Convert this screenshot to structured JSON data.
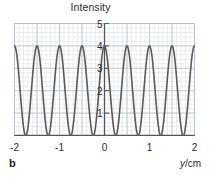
{
  "figure": {
    "panel_label": "b",
    "title": "Intensity",
    "x_axis_title_variable": "y",
    "x_axis_title_unit": "/cm",
    "x_axis_title": "y/cm"
  },
  "colors": {
    "curve": "#5a5a5a",
    "axis": "#555555",
    "grid_major": "#b9c3cc",
    "grid_minor": "#dfe5ea",
    "text": "#2b2b2b",
    "background": "#ffffff"
  },
  "chart_data": {
    "type": "line",
    "title": "Intensity",
    "xlabel": "y/cm",
    "ylabel": "Intensity",
    "xlim": [
      -2,
      2
    ],
    "ylim": [
      0,
      5
    ],
    "grid": true,
    "grid_major_x_step": 0.5,
    "grid_major_y_step": 1,
    "grid_minor_x_step": 0.1,
    "grid_minor_y_step": 0.2,
    "legend": "none",
    "xticks": [
      -2,
      -1,
      0,
      1,
      2
    ],
    "xtick_labels": [
      "-2",
      "-1",
      "0",
      "1",
      "2"
    ],
    "yticks": [
      1,
      2,
      3,
      4,
      5
    ],
    "ytick_labels": [
      "1",
      "2",
      "3",
      "4",
      "5"
    ],
    "function": "I = 4*cos(pi*y/0.5)^2",
    "amplitude_max": 4,
    "amplitude_min": 0,
    "period_cm": 0.5,
    "peak_positions": [
      -1.75,
      -1.25,
      -0.75,
      -0.25,
      0.25,
      0.75,
      1.25,
      1.75
    ],
    "peak_value": 4,
    "minima_positions": [
      -2.0,
      -1.5,
      -1.0,
      -0.5,
      0.0,
      0.5,
      1.0,
      1.5,
      2.0
    ],
    "minimum_value": 0,
    "peaks_visible_count": 8,
    "edge_values": {
      "left_x": -2,
      "left_y": 0,
      "right_x": 2,
      "right_y": 0
    },
    "series": [
      {
        "name": "Intensity",
        "x": [
          -2.0,
          -1.95,
          -1.9,
          -1.85,
          -1.8,
          -1.75,
          -1.7,
          -1.65,
          -1.6,
          -1.55,
          -1.5,
          -1.45,
          -1.4,
          -1.35,
          -1.3,
          -1.25,
          -1.2,
          -1.15,
          -1.1,
          -1.05,
          -1.0,
          -0.95,
          -0.9,
          -0.85,
          -0.8,
          -0.75,
          -0.7,
          -0.65,
          -0.6,
          -0.55,
          -0.5,
          -0.45,
          -0.4,
          -0.35,
          -0.3,
          -0.25,
          -0.2,
          -0.15,
          -0.1,
          -0.05,
          0.0,
          0.05,
          0.1,
          0.15,
          0.2,
          0.25,
          0.3,
          0.35,
          0.4,
          0.45,
          0.5,
          0.55,
          0.6,
          0.65,
          0.7,
          0.75,
          0.8,
          0.85,
          0.9,
          0.95,
          1.0,
          1.05,
          1.1,
          1.15,
          1.2,
          1.25,
          1.3,
          1.35,
          1.4,
          1.45,
          1.5,
          1.55,
          1.6,
          1.65,
          1.7,
          1.75,
          1.8,
          1.85,
          1.9,
          1.95,
          2.0
        ],
        "y": [
          0.0,
          0.38,
          1.38,
          2.62,
          3.62,
          4.0,
          3.62,
          2.62,
          1.38,
          0.38,
          0.0,
          0.38,
          1.38,
          2.62,
          3.62,
          4.0,
          3.62,
          2.62,
          1.38,
          0.38,
          0.0,
          0.38,
          1.38,
          2.62,
          3.62,
          4.0,
          3.62,
          2.62,
          1.38,
          0.38,
          0.0,
          0.38,
          1.38,
          2.62,
          3.62,
          4.0,
          3.62,
          2.62,
          1.38,
          0.38,
          0.0,
          0.38,
          1.38,
          2.62,
          3.62,
          4.0,
          3.62,
          2.62,
          1.38,
          0.38,
          0.0,
          0.38,
          1.38,
          2.62,
          3.62,
          4.0,
          3.62,
          2.62,
          1.38,
          0.38,
          0.0,
          0.38,
          1.38,
          2.62,
          3.62,
          4.0,
          3.62,
          2.62,
          1.38,
          0.38,
          0.0,
          0.38,
          1.38,
          2.62,
          3.62,
          4.0,
          3.62,
          2.62,
          1.38,
          0.38,
          0.0
        ]
      }
    ]
  }
}
